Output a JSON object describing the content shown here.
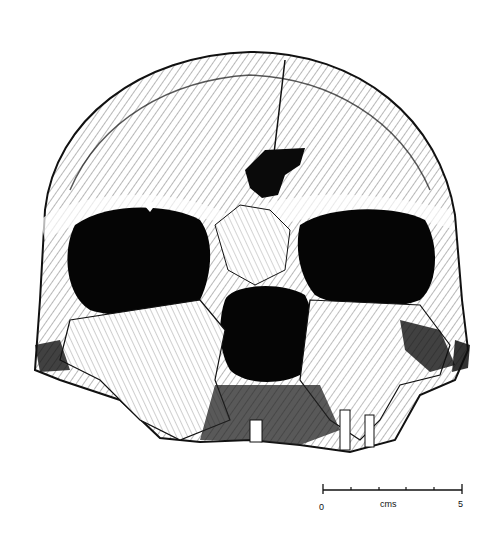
{
  "figure": {
    "colors": {
      "ink": "#0a0a0a",
      "paper": "#ffffff"
    }
  },
  "scale_bar": {
    "start_label": "0",
    "unit_label": "cms",
    "end_label": "5",
    "divisions": 5
  }
}
